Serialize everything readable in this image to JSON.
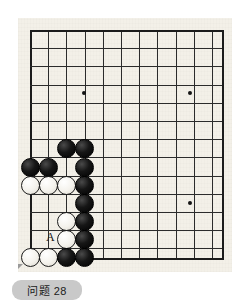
{
  "caption": {
    "text": "问题 28"
  },
  "marker": {
    "letter": "A",
    "x": 46,
    "y": 237
  },
  "board": {
    "colors": {
      "paper": "#f3f0e8",
      "line": "#2b2b2b",
      "edge": "#1b1b1b",
      "black_stone": "#111111",
      "white_stone": "#f6f4ee",
      "caption_chip": "#c9c9c9"
    },
    "geometry": {
      "origin_x": 30,
      "origin_y": 30,
      "cell": 18.2,
      "cols": 11,
      "rows": 13,
      "right_edge_x": 222,
      "bottom_edge_y": 258
    },
    "star_points": [
      {
        "x": 84,
        "y": 93
      },
      {
        "x": 190,
        "y": 93
      },
      {
        "x": 190,
        "y": 203
      }
    ],
    "stones": [
      {
        "color": "black",
        "x": 66,
        "y": 148
      },
      {
        "color": "black",
        "x": 84,
        "y": 148
      },
      {
        "color": "black",
        "x": 30,
        "y": 167
      },
      {
        "color": "black",
        "x": 48,
        "y": 167
      },
      {
        "color": "black",
        "x": 84,
        "y": 167
      },
      {
        "color": "white",
        "x": 30,
        "y": 185
      },
      {
        "color": "white",
        "x": 48,
        "y": 185
      },
      {
        "color": "white",
        "x": 66,
        "y": 185
      },
      {
        "color": "black",
        "x": 84,
        "y": 185
      },
      {
        "color": "black",
        "x": 84,
        "y": 203
      },
      {
        "color": "white",
        "x": 66,
        "y": 221
      },
      {
        "color": "black",
        "x": 84,
        "y": 221
      },
      {
        "color": "white",
        "x": 66,
        "y": 239
      },
      {
        "color": "black",
        "x": 84,
        "y": 239
      },
      {
        "color": "white",
        "x": 30,
        "y": 257
      },
      {
        "color": "white",
        "x": 48,
        "y": 257
      },
      {
        "color": "black",
        "x": 66,
        "y": 257
      },
      {
        "color": "black",
        "x": 84,
        "y": 257
      }
    ]
  }
}
